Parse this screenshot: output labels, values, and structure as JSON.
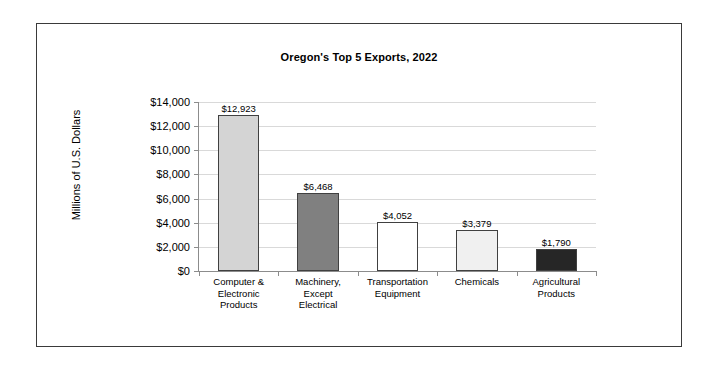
{
  "chart_data": {
    "type": "bar",
    "title": "Oregon's Top 5 Exports, 2022",
    "xlabel": "",
    "ylabel": "Millions of U.S. Dollars",
    "ylim": [
      0,
      14000
    ],
    "ytick_step": 2000,
    "grid": true,
    "legend": false,
    "categories": [
      "Computer &\nElectronic\nProducts",
      "Machinery,\nExcept\nElectrical",
      "Transportation\nEquipment",
      "Chemicals",
      "Agricultural\nProducts"
    ],
    "values": [
      12923,
      6468,
      4052,
      3379,
      1790
    ],
    "value_labels": [
      "$12,923",
      "$6,468",
      "$4,052",
      "$3,379",
      "$1,790"
    ],
    "bar_colors": [
      "#d4d4d4",
      "#808080",
      "#ffffff",
      "#f0f0f0",
      "#262626"
    ],
    "bar_edge_color": "#404040",
    "ytick_labels": [
      "$0",
      "$2,000",
      "$4,000",
      "$6,000",
      "$8,000",
      "$10,000",
      "$12,000",
      "$14,000"
    ],
    "ytick_values": [
      0,
      2000,
      4000,
      6000,
      8000,
      10000,
      12000,
      14000
    ],
    "gridline_color": "#d9d9d9",
    "axis_color": "#8c8c8c",
    "frame_color": "#3a3a3a",
    "background": "#ffffff"
  }
}
